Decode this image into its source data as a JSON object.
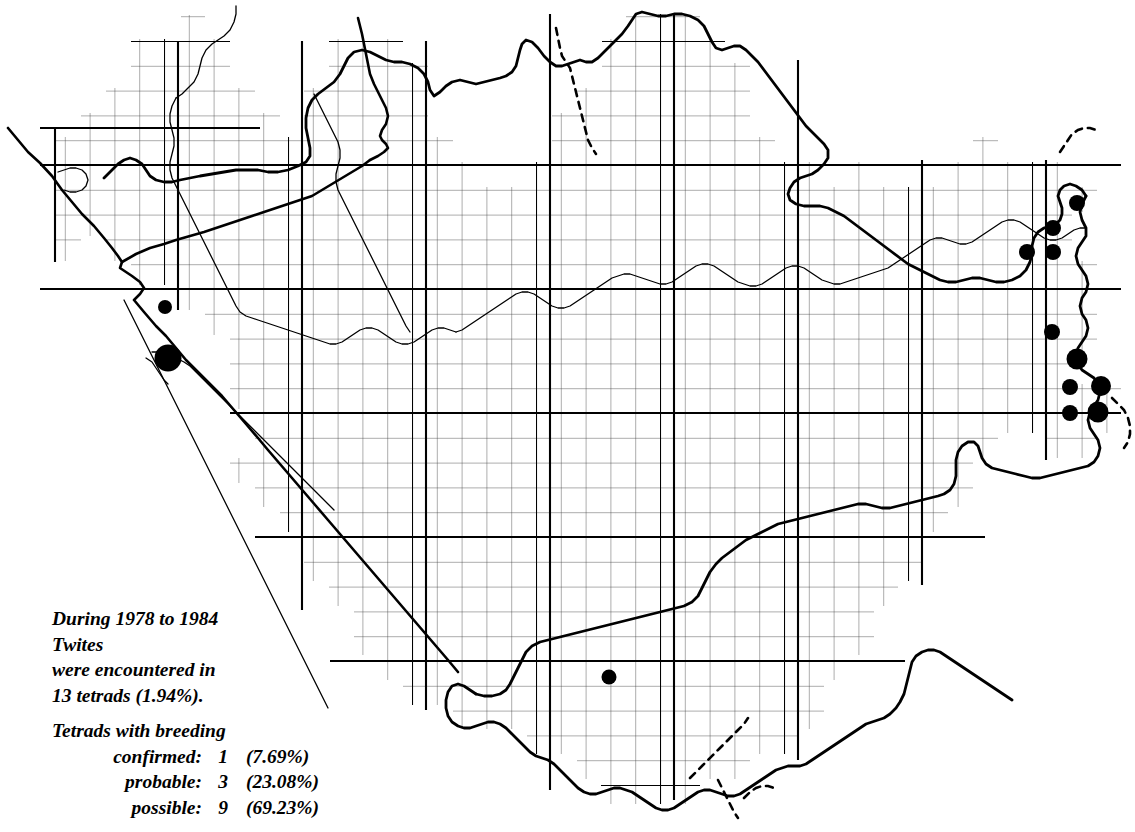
{
  "map": {
    "title": "Twite tetrad distribution map",
    "colors": {
      "ink": "#000000",
      "grid_minor": "#3a3a3a",
      "grid_major": "#000000",
      "background": "#ffffff"
    },
    "grid": {
      "cell_px": 24.8,
      "major_every": 5,
      "origin_x": 40.0,
      "origin_y": 41.0
    }
  },
  "caption": {
    "line1": "During 1978 to 1984",
    "line2": "Twites",
    "line3": "were encountered in",
    "line4": "13 tetrads (1.94%).",
    "breeding_heading": "Tetrads with breeding",
    "breeding_rows": [
      {
        "label": "confirmed:",
        "count": "1",
        "percent": "(7.69%)"
      },
      {
        "label": "probable:",
        "count": "3",
        "percent": "(23.08%)"
      },
      {
        "label": "possible:",
        "count": "9",
        "percent": "(69.23%)"
      }
    ]
  },
  "chart_data": {
    "type": "scatter",
    "xlabel": "",
    "ylabel": "",
    "total_tetrads": 13,
    "total_percent": 1.94,
    "categories": [
      "confirmed",
      "probable",
      "possible"
    ],
    "values": [
      1,
      3,
      9
    ],
    "percents": [
      7.69,
      23.08,
      69.23
    ],
    "legend": [
      "large dot = breeding confirmed",
      "medium dot = probable",
      "small dot = possible"
    ],
    "points": [
      {
        "x": 165,
        "y": 307,
        "r": 7.0
      },
      {
        "x": 168,
        "y": 358,
        "r": 13.5
      },
      {
        "x": 1077,
        "y": 203,
        "r": 8.0
      },
      {
        "x": 1053,
        "y": 228,
        "r": 8.0
      },
      {
        "x": 1027,
        "y": 252,
        "r": 8.0
      },
      {
        "x": 1053,
        "y": 252,
        "r": 8.0
      },
      {
        "x": 1052,
        "y": 332,
        "r": 8.0
      },
      {
        "x": 1077,
        "y": 359,
        "r": 10.5
      },
      {
        "x": 1070,
        "y": 387,
        "r": 8.0
      },
      {
        "x": 1101,
        "y": 386,
        "r": 10.0
      },
      {
        "x": 1070,
        "y": 413,
        "r": 8.0
      },
      {
        "x": 1098,
        "y": 412,
        "r": 10.5
      },
      {
        "x": 609,
        "y": 677,
        "r": 7.5
      }
    ]
  }
}
